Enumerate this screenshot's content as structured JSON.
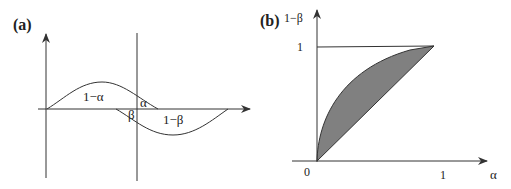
{
  "panel_a": {
    "label": "(a)",
    "regions": {
      "one_minus_alpha": "1−α",
      "alpha": "α",
      "beta": "β",
      "one_minus_beta": "1−β"
    }
  },
  "panel_b": {
    "label": "(b)",
    "y_axis_label": "1−β",
    "x_axis_label": "α",
    "y_tick": "1",
    "x_tick": "1",
    "origin": "0",
    "fill_color": "#808080"
  }
}
